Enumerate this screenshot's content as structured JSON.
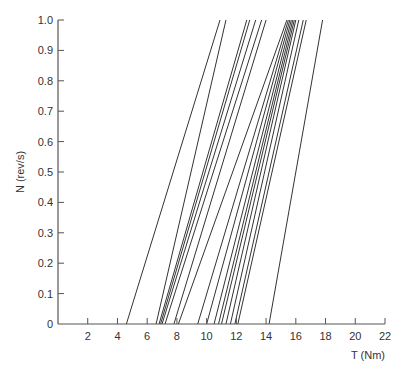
{
  "chart_data": {
    "type": "line",
    "title": "",
    "xlabel": "T (Nm)",
    "ylabel": "N (rev/s)",
    "xlim": [
      0,
      22
    ],
    "ylim": [
      0,
      1.0
    ],
    "grid": false,
    "legend": null,
    "x_ticks": [
      2,
      4,
      6,
      8,
      10,
      12,
      14,
      16,
      18,
      20,
      22
    ],
    "y_ticks": [
      0,
      0.1,
      0.2,
      0.3,
      0.4,
      0.5,
      0.6,
      0.7,
      0.8,
      0.9,
      1.0
    ],
    "y_tick_labels": [
      "0",
      "0.1",
      "0.2",
      "0.3",
      "0.4",
      "0.5",
      "0.6",
      "0.7",
      "0.8",
      "0.9",
      "1.0"
    ],
    "series": [
      {
        "name": "line1",
        "x": [
          4.6,
          10.9
        ],
        "y": [
          0,
          1.0
        ]
      },
      {
        "name": "line2",
        "x": [
          6.6,
          11.3
        ],
        "y": [
          0,
          1.0
        ]
      },
      {
        "name": "line3",
        "x": [
          6.8,
          12.7
        ],
        "y": [
          0,
          1.0
        ]
      },
      {
        "name": "line4",
        "x": [
          6.9,
          12.9
        ],
        "y": [
          0,
          1.0
        ]
      },
      {
        "name": "line5",
        "x": [
          7.0,
          13.3
        ],
        "y": [
          0,
          1.0
        ]
      },
      {
        "name": "line6",
        "x": [
          7.2,
          13.7
        ],
        "y": [
          0,
          1.0
        ]
      },
      {
        "name": "line7",
        "x": [
          7.8,
          14.0
        ],
        "y": [
          0,
          1.0
        ]
      },
      {
        "name": "line8",
        "x": [
          8.1,
          15.4
        ],
        "y": [
          0,
          1.0
        ]
      },
      {
        "name": "line9",
        "x": [
          9.4,
          15.5
        ],
        "y": [
          0,
          1.0
        ]
      },
      {
        "name": "line10",
        "x": [
          10.0,
          15.6
        ],
        "y": [
          0,
          1.0
        ]
      },
      {
        "name": "line11",
        "x": [
          10.5,
          15.7
        ],
        "y": [
          0,
          1.0
        ]
      },
      {
        "name": "line12",
        "x": [
          10.8,
          15.8
        ],
        "y": [
          0,
          1.0
        ]
      },
      {
        "name": "line13",
        "x": [
          11.0,
          15.9
        ],
        "y": [
          0,
          1.0
        ]
      },
      {
        "name": "line14",
        "x": [
          11.3,
          16.0
        ],
        "y": [
          0,
          1.0
        ]
      },
      {
        "name": "line15",
        "x": [
          11.6,
          16.2
        ],
        "y": [
          0,
          1.0
        ]
      },
      {
        "name": "line16",
        "x": [
          11.9,
          16.5
        ],
        "y": [
          0,
          1.0
        ]
      },
      {
        "name": "line17",
        "x": [
          12.1,
          16.7
        ],
        "y": [
          0,
          1.0
        ]
      },
      {
        "name": "line18",
        "x": [
          14.2,
          17.8
        ],
        "y": [
          0,
          1.0
        ]
      }
    ]
  },
  "axes": {
    "xlabel": "T (Nm)",
    "ylabel": "N (rev/s)"
  }
}
